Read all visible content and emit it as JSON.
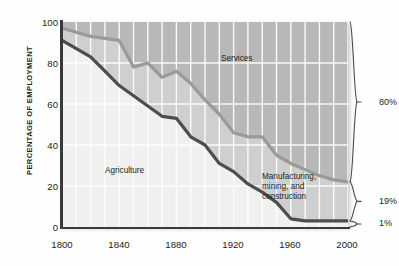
{
  "chart_data": {
    "type": "area",
    "title": "",
    "subtitle": "",
    "xlabel": "",
    "ylabel": "PERCENTAGE OF EMPLOYMENT",
    "xlim": [
      1800,
      2000
    ],
    "ylim": [
      0,
      100
    ],
    "xticks": [
      "1800",
      "1840",
      "1880",
      "1920",
      "1960",
      "2000"
    ],
    "xtick_values": [
      1800,
      1840,
      1880,
      1920,
      1960,
      2000
    ],
    "yticks": [
      "0",
      "20",
      "40",
      "60",
      "80",
      "100"
    ],
    "ytick_values": [
      0,
      20,
      40,
      60,
      80,
      100
    ],
    "grid": true,
    "grid_x_step": 10,
    "grid_y_step": 20,
    "legend": "none",
    "stacked": true,
    "x": [
      1800,
      1810,
      1820,
      1830,
      1840,
      1850,
      1860,
      1870,
      1880,
      1890,
      1900,
      1910,
      1920,
      1930,
      1940,
      1950,
      1960,
      1970,
      1980,
      1990,
      2000
    ],
    "series": [
      {
        "name": "Agriculture",
        "color": "#4d4d4d",
        "comment": "cumulative lower boundary line = agriculture share",
        "values": [
          91,
          87,
          83,
          76,
          69,
          64,
          59,
          54,
          53,
          44,
          40,
          31,
          27,
          21,
          17,
          12,
          4,
          3,
          3,
          3,
          3
        ]
      },
      {
        "name": "Manufacturing, mining, and construction",
        "color": "#9a9a9a",
        "comment": "band between lower and upper boundary lines",
        "values": [
          6,
          7,
          8,
          15,
          22,
          14,
          21,
          26,
          23,
          32,
          36,
          33,
          28,
          26,
          28,
          23,
          31,
          26,
          23,
          21,
          19
        ]
      },
      {
        "name": "Services",
        "color": "#b8b8b8",
        "comment": "top band, remainder up to 100",
        "values": [
          3,
          6,
          9,
          9,
          9,
          22,
          20,
          20,
          24,
          24,
          24,
          36,
          45,
          53,
          55,
          65,
          65,
          71,
          74,
          76,
          78
        ]
      }
    ],
    "boundary_lines": [
      {
        "name": "agriculture-upper-boundary",
        "color": "#4d4d4d",
        "points": [
          [
            1800,
            91
          ],
          [
            1810,
            87
          ],
          [
            1820,
            83
          ],
          [
            1830,
            76
          ],
          [
            1840,
            69
          ],
          [
            1850,
            64
          ],
          [
            1860,
            59
          ],
          [
            1870,
            54
          ],
          [
            1880,
            53
          ],
          [
            1890,
            44
          ],
          [
            1900,
            40
          ],
          [
            1910,
            31
          ],
          [
            1920,
            27
          ],
          [
            1930,
            21
          ],
          [
            1940,
            17
          ],
          [
            1950,
            12
          ],
          [
            1960,
            4
          ],
          [
            1970,
            3
          ],
          [
            1980,
            3
          ],
          [
            1990,
            3
          ],
          [
            2000,
            3
          ]
        ]
      },
      {
        "name": "manufacturing-upper-boundary",
        "color": "#9a9a9a",
        "points": [
          [
            1800,
            97
          ],
          [
            1810,
            95
          ],
          [
            1820,
            93
          ],
          [
            1830,
            92
          ],
          [
            1840,
            91
          ],
          [
            1850,
            78
          ],
          [
            1860,
            80
          ],
          [
            1870,
            73
          ],
          [
            1880,
            76
          ],
          [
            1890,
            70
          ],
          [
            1900,
            62
          ],
          [
            1910,
            55
          ],
          [
            1920,
            46
          ],
          [
            1930,
            44
          ],
          [
            1940,
            44
          ],
          [
            1950,
            35
          ],
          [
            1960,
            31
          ],
          [
            1970,
            28
          ],
          [
            1980,
            25
          ],
          [
            1990,
            23
          ],
          [
            2000,
            22
          ]
        ]
      }
    ],
    "annotations": [
      {
        "name": "services-label",
        "text": "Services",
        "x": 1930,
        "y": 82
      },
      {
        "name": "agriculture-label",
        "text": "Agriculture",
        "x": 1845,
        "y": 24
      },
      {
        "name": "manufacturing-label",
        "text": "Manufacturing,\nmining, and\nconstruction",
        "x": 1955,
        "y": 18
      }
    ],
    "right_brackets": [
      {
        "name": "services-share",
        "label": "80%",
        "from": 100,
        "to": 22
      },
      {
        "name": "manufacturing-share",
        "label": "19%",
        "from": 22,
        "to": 3
      },
      {
        "name": "agriculture-share",
        "label": "1%",
        "from": 3,
        "to": 0
      }
    ]
  },
  "axis": {
    "ylabel": "PERCENTAGE OF EMPLOYMENT",
    "yticks": [
      "100",
      "80",
      "60",
      "40",
      "20",
      "0"
    ],
    "xticks": [
      "1800",
      "1840",
      "1880",
      "1920",
      "1960",
      "2000"
    ]
  },
  "labels": {
    "services": "Services",
    "agriculture": "Agriculture",
    "manufacturing": "Manufacturing,\nmining, and\nconstruction"
  },
  "brackets": {
    "services_pct": "80%",
    "manufacturing_pct": "19%",
    "agriculture_pct": "1%"
  },
  "colors": {
    "agriculture_line": "#4d4d4d",
    "manufacturing_line": "#9a9a9a",
    "services_band": "#b8b8b8",
    "manufacturing_band": "#cfcfcf",
    "agriculture_band": "#f0f0f0",
    "axis": "#3a3a3a",
    "text": "#231f20",
    "grid": "#ffffff"
  }
}
